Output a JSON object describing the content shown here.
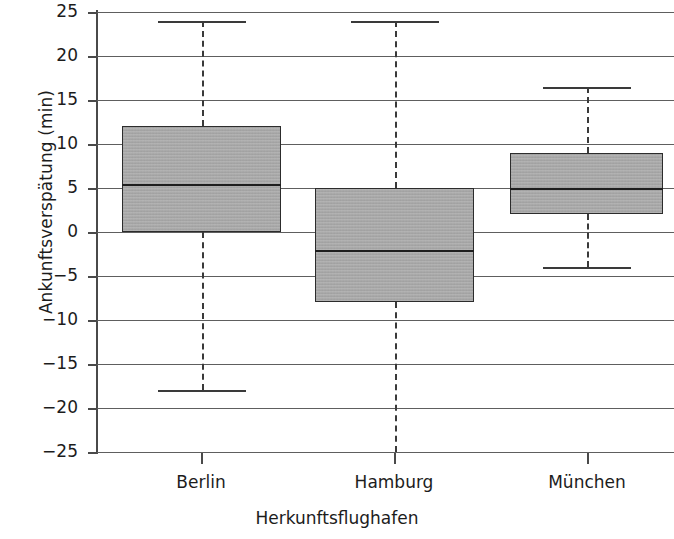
{
  "chart_data": {
    "type": "box",
    "title": "",
    "xlabel": "Herkunftsflughafen",
    "ylabel": "Ankunftsverspätung (min)",
    "categories": [
      "Berlin",
      "Hamburg",
      "München"
    ],
    "ylim": [
      -25,
      25
    ],
    "yticks": [
      25,
      20,
      15,
      10,
      5,
      0,
      -5,
      -10,
      -15,
      -20,
      -25
    ],
    "ytick_labels": [
      "25",
      "20",
      "15",
      "10",
      "5",
      "0",
      "−5",
      "−10",
      "−15",
      "−20",
      "−25"
    ],
    "grid": true,
    "legend": "none",
    "boxes": [
      {
        "category": "Berlin",
        "whisker_high": 24,
        "q3": 12,
        "median": 5.5,
        "q1": 0,
        "whisker_low": -18,
        "whisker_low_clipped": false,
        "whisker_high_clipped": false
      },
      {
        "category": "Hamburg",
        "whisker_high": 24,
        "q3": 5,
        "median": -2,
        "q1": -8,
        "whisker_low": -25,
        "whisker_low_clipped": true,
        "whisker_high_clipped": false
      },
      {
        "category": "München",
        "whisker_high": 16.5,
        "q3": 9,
        "median": 5,
        "q1": 2,
        "whisker_low": -4,
        "whisker_low_clipped": false,
        "whisker_high_clipped": false
      }
    ]
  },
  "style": {
    "box_fill": "#a9a9a9",
    "box_edge": "#2c2c2c",
    "median_color": "#1e1e1e",
    "whisker_color": "#3a3a3a",
    "grid_color": "#5e5e5e",
    "axis_color": "#4a4a4a",
    "text_color": "#1c1c1c",
    "background": "#ffffff"
  }
}
